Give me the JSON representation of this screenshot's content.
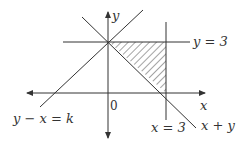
{
  "diagram": {
    "labels": {
      "y_axis": "y",
      "x_axis": "x",
      "origin": "0",
      "line_y3": "y = 3",
      "line_x3": "x = 3",
      "line_xy": "x + y",
      "line_yxk": "y − x = k"
    },
    "colors": {
      "line": "#333333",
      "hatch": "#555555"
    }
  }
}
